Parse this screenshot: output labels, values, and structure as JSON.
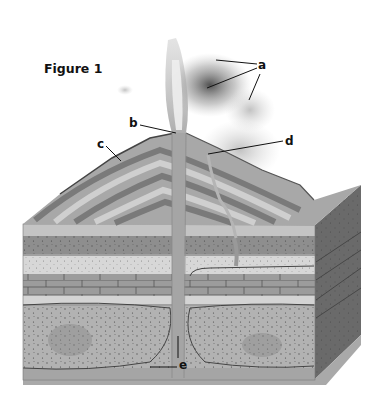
{
  "figure": {
    "title": "Figure 1",
    "labels": [
      {
        "id": "a",
        "text": "a"
      },
      {
        "id": "b",
        "text": "b"
      },
      {
        "id": "c",
        "text": "c"
      },
      {
        "id": "d",
        "text": "d"
      },
      {
        "id": "e",
        "text": "e"
      }
    ]
  }
}
